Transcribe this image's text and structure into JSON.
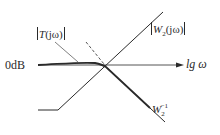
{
  "diagram": {
    "type": "bode-magnitude-sketch",
    "axis": {
      "y_ref_label": "0dB",
      "x_label": "lg ω"
    },
    "curves": [
      {
        "name": "T",
        "label_prefix": "T",
        "label_arg": "(jω)",
        "style": "solid-thick",
        "description": "flat at 0dB then rolls off along W2^-1"
      },
      {
        "name": "W2",
        "label_prefix": "W",
        "label_sub": "2",
        "label_arg": "(jω)",
        "style": "solid",
        "description": "flat low then rising asymptote"
      },
      {
        "name": "W2inv",
        "label_prefix": "W",
        "label_sub": "2",
        "label_sup": "−1",
        "style": "solid",
        "description": "falling asymptote"
      },
      {
        "name": "dashed",
        "style": "dashed",
        "description": "dashed extension above crossing"
      }
    ],
    "colors": {
      "line": "#2a2a2a",
      "background": "#ffffff"
    }
  }
}
